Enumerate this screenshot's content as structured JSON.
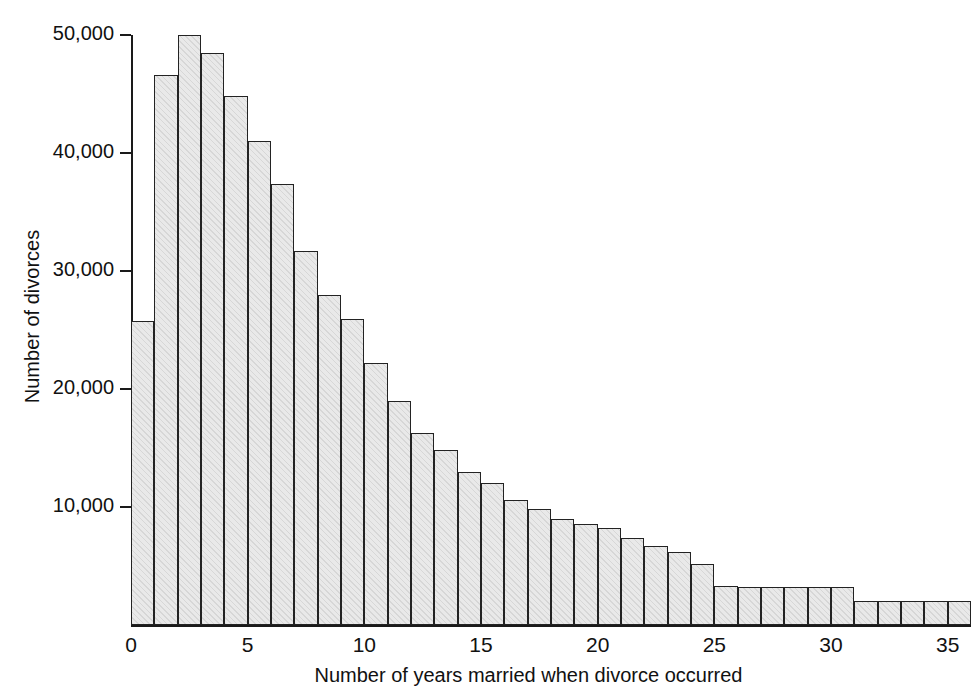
{
  "chart_data": {
    "type": "bar",
    "title": "",
    "subtitle": "",
    "xlabel": "Number of years married when divorce occurred",
    "ylabel": "Number of divorces",
    "xlim": [
      0,
      36
    ],
    "ylim": [
      0,
      50000
    ],
    "grid": false,
    "legend": null,
    "bar_fill_color": "#e9e9e9",
    "bar_edge_color": "#232323",
    "axis_color": "#1a1a1a",
    "text_color": "#111111",
    "background_color": "#ffffff",
    "ytick_values": [
      10000,
      20000,
      30000,
      40000,
      50000
    ],
    "ytick_labels": [
      "10,000",
      "20,000",
      "30,000",
      "40,000",
      "50,000"
    ],
    "xtick_values": [
      0,
      5,
      10,
      15,
      20,
      25,
      30,
      35
    ],
    "xtick_labels": [
      "0",
      "5",
      "10",
      "15",
      "20",
      "25",
      "30",
      "35"
    ],
    "bin_width": 1,
    "categories": [
      0,
      1,
      2,
      3,
      4,
      5,
      6,
      7,
      8,
      9,
      10,
      11,
      12,
      13,
      14,
      15,
      16,
      17,
      18,
      19,
      20,
      21,
      22,
      23,
      24,
      25,
      26,
      27,
      28,
      29,
      30,
      31,
      32,
      33,
      34,
      35
    ],
    "values": [
      25800,
      46600,
      50000,
      48500,
      44800,
      41000,
      37400,
      31700,
      28000,
      25900,
      22200,
      19000,
      16300,
      14800,
      13000,
      12000,
      10600,
      9800,
      9000,
      8600,
      8200,
      7400,
      6700,
      6200,
      5200,
      3300,
      3200,
      3200,
      3200,
      3200,
      3200,
      2000,
      2000,
      2000,
      2000,
      2000
    ]
  }
}
